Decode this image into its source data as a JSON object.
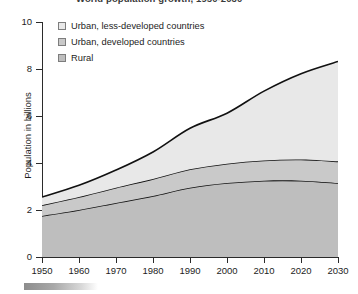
{
  "chart_data": {
    "type": "area",
    "stacked": true,
    "title": "World population growth, 1950-2030",
    "xlabel": "",
    "ylabel": "Population in billions",
    "xlim": [
      1950,
      2030
    ],
    "ylim": [
      0,
      10
    ],
    "grid": false,
    "legend_position": "top-left-inside",
    "x": [
      1950,
      1960,
      1970,
      1980,
      1990,
      2000,
      2010,
      2020,
      2030
    ],
    "xticklabels": [
      "1950",
      "1960",
      "1970",
      "1980",
      "1990",
      "2000",
      "2010",
      "2020",
      "2030"
    ],
    "yticks": [
      0,
      2,
      4,
      6,
      8,
      10
    ],
    "yticklabels": [
      "0",
      "2",
      "4",
      "6",
      "8",
      "10"
    ],
    "series": [
      {
        "name": "Rural",
        "color": "#bebebe",
        "values": [
          1.75,
          2.0,
          2.3,
          2.6,
          2.95,
          3.15,
          3.25,
          3.25,
          3.15
        ]
      },
      {
        "name": "Urban, developed countries",
        "color": "#c9c9c9",
        "values": [
          0.45,
          0.55,
          0.65,
          0.72,
          0.78,
          0.82,
          0.86,
          0.9,
          0.92
        ]
      },
      {
        "name": "Urban, less-developed countries",
        "color": "#e8e8e8",
        "values": [
          0.35,
          0.5,
          0.75,
          1.15,
          1.75,
          2.15,
          2.95,
          3.65,
          4.25
        ]
      }
    ],
    "totals": [
      2.55,
      3.05,
      3.7,
      4.47,
      5.48,
      6.12,
      7.06,
      7.8,
      8.32
    ],
    "line_color": "#111111"
  },
  "legend": {
    "items": [
      {
        "label": "Urban, less-developed countries",
        "color": "#e8e8e8"
      },
      {
        "label": "Urban, developed countries",
        "color": "#c9c9c9"
      },
      {
        "label": "Rural",
        "color": "#bebebe"
      }
    ]
  }
}
